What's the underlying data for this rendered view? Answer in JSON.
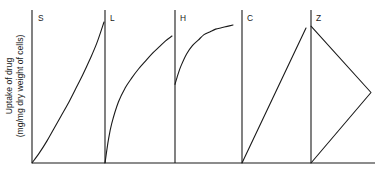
{
  "figure": {
    "y_axis_label_line1": "Uptake of drug",
    "y_axis_label_line2": "(mg/mg dry weight of cells)",
    "panel_labels": [
      "S",
      "L",
      "H",
      "C",
      "Z"
    ],
    "line_color": "#1a1a1a",
    "background_color": "#ffffff"
  },
  "chart_data": {
    "type": "line",
    "title": "",
    "subtitle": "",
    "xlabel": "",
    "ylabel": "Uptake of drug (mg/mg dry weight of cells)",
    "grid": false,
    "legend": "none",
    "axis_tick_labels": {
      "x": [],
      "y": []
    },
    "note": "Five adsorption-isotherm classification curves (S, L, H, C, Z) drawn side by side on a shared horizontal baseline; each panel has its own vertical axis and is unlabelled numerically.",
    "panels": [
      {
        "name": "S",
        "label": "S",
        "description": "Sigmoidal / convex-upward curve rising from the origin with increasing slope",
        "xlim": [
          0,
          1
        ],
        "ylim": [
          0,
          1
        ],
        "x": [
          0.0,
          0.1,
          0.2,
          0.3,
          0.4,
          0.5,
          0.6,
          0.7,
          0.8,
          0.9,
          1.0
        ],
        "y": [
          0.0,
          0.07,
          0.15,
          0.24,
          0.33,
          0.42,
          0.52,
          0.62,
          0.73,
          0.85,
          1.0
        ]
      },
      {
        "name": "L",
        "label": "L",
        "description": "Langmuir type: concave-downward curve from the origin, steep at first then flattening",
        "xlim": [
          0,
          1
        ],
        "ylim": [
          0,
          1
        ],
        "x": [
          0.0,
          0.05,
          0.1,
          0.2,
          0.3,
          0.4,
          0.5,
          0.6,
          0.7,
          0.8,
          0.9,
          1.0
        ],
        "y": [
          0.0,
          0.18,
          0.31,
          0.48,
          0.59,
          0.67,
          0.74,
          0.8,
          0.86,
          0.91,
          0.96,
          1.0
        ]
      },
      {
        "name": "H",
        "label": "H",
        "description": "High-affinity: curve begins at a high intercept on the vertical axis and saturates to a plateau",
        "xlim": [
          0,
          1
        ],
        "ylim": [
          0,
          1
        ],
        "x": [
          0.0,
          0.05,
          0.1,
          0.2,
          0.3,
          0.4,
          0.5,
          0.6,
          0.7,
          0.8,
          0.9,
          1.0
        ],
        "y": [
          0.57,
          0.64,
          0.7,
          0.79,
          0.85,
          0.89,
          0.93,
          0.95,
          0.97,
          0.98,
          0.99,
          1.0
        ]
      },
      {
        "name": "C",
        "label": "C",
        "description": "Constant partition: straight line rising from the origin",
        "xlim": [
          0,
          1
        ],
        "ylim": [
          0,
          1
        ],
        "x": [
          0.0,
          1.0
        ],
        "y": [
          0.0,
          1.0
        ]
      },
      {
        "name": "Z",
        "label": "Z",
        "description": "Zig-zag: straight segment from a high point on the vertical axis down to a vertex at the right, then back down-left to the origin",
        "xlim": [
          0,
          1
        ],
        "ylim": [
          0,
          1
        ],
        "x": [
          0.0,
          1.0,
          0.0
        ],
        "y": [
          0.97,
          0.5,
          0.0
        ]
      }
    ]
  }
}
